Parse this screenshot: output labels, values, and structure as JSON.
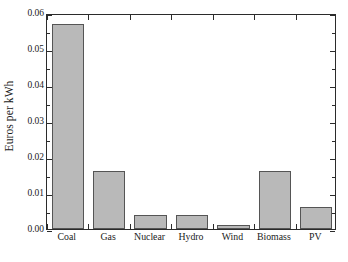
{
  "chart_data": {
    "type": "bar",
    "title": "",
    "xlabel": "",
    "ylabel": "Euros per kWh",
    "categories": [
      "Coal",
      "Gas",
      "Nuclear",
      "Hydro",
      "Wind",
      "Biomass",
      "PV"
    ],
    "values": [
      0.057,
      0.016,
      0.004,
      0.004,
      0.001,
      0.016,
      0.006
    ],
    "ylim": [
      0.0,
      0.06
    ],
    "ytick_labels": [
      "0.00",
      "0.01",
      "0.02",
      "0.03",
      "0.04",
      "0.05",
      "0.06"
    ],
    "ytick_values": [
      0.0,
      0.01,
      0.02,
      0.03,
      0.04,
      0.05,
      0.06
    ],
    "yminor_values": [
      0.005,
      0.015,
      0.025,
      0.035,
      0.045,
      0.055
    ],
    "grid": false,
    "legend": "none",
    "bar_color": "#b9b9b9",
    "bar_edge_color": "#555555",
    "axis_color": "#2b2b2b",
    "background_color": "#ffffff"
  }
}
